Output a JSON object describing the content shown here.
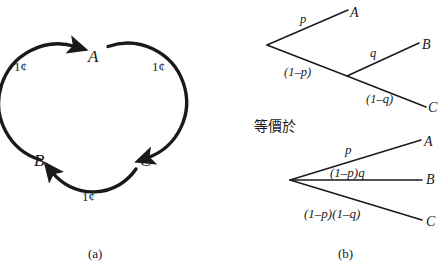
{
  "figure": {
    "background_color": "#ffffff",
    "ink_color": "#1a1a1a"
  },
  "panel_a": {
    "caption": "(a)",
    "nodes": [
      {
        "id": "A",
        "label": "A",
        "x": 88,
        "y": 48
      },
      {
        "id": "B",
        "label": "B",
        "x": 34,
        "y": 152
      },
      {
        "id": "C",
        "label": "C",
        "x": 140,
        "y": 152
      }
    ],
    "edges": [
      {
        "from": "B",
        "to": "A",
        "label": "1¢",
        "label_x": 14,
        "label_y": 60
      },
      {
        "from": "A",
        "to": "C",
        "label": "1¢",
        "label_x": 152,
        "label_y": 60
      },
      {
        "from": "C",
        "to": "B",
        "label": "1¢",
        "label_x": 82,
        "label_y": 190
      }
    ]
  },
  "panel_b": {
    "caption": "(b)",
    "equivalence_text": "等價於",
    "tree_top": {
      "root": {
        "x": 267,
        "y": 45
      },
      "branch": {
        "x": 347,
        "y": 76
      },
      "leaves": [
        {
          "label": "A",
          "x": 350,
          "y": 6
        },
        {
          "label": "B",
          "x": 422,
          "y": 38
        },
        {
          "label": "C",
          "x": 428,
          "y": 101
        }
      ],
      "edge_labels": [
        {
          "text": "p",
          "x": 300,
          "y": 13
        },
        {
          "text": "(1–p)",
          "x": 284,
          "y": 66
        },
        {
          "text": "q",
          "x": 370,
          "y": 47
        },
        {
          "text": "(1–q)",
          "x": 366,
          "y": 93
        }
      ]
    },
    "tree_bottom": {
      "root": {
        "x": 290,
        "y": 180
      },
      "leaves": [
        {
          "label": "A",
          "x": 424,
          "y": 135
        },
        {
          "label": "B",
          "x": 426,
          "y": 173
        },
        {
          "label": "C",
          "x": 426,
          "y": 215
        }
      ],
      "edge_labels": [
        {
          "text": "p",
          "x": 345,
          "y": 143
        },
        {
          "text": "(1–p)q",
          "x": 330,
          "y": 166
        },
        {
          "text": "(1–p)(1–q)",
          "x": 304,
          "y": 207
        }
      ]
    }
  }
}
